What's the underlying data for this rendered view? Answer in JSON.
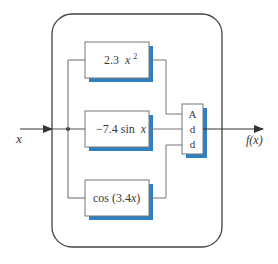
{
  "diagram": {
    "input_label": "x",
    "output_label": "f(x)",
    "blocks": [
      {
        "id": "top",
        "coef": "2.3",
        "term": "x",
        "sup": "2"
      },
      {
        "id": "middle",
        "coef": "−7.4 sin",
        "term": "x"
      },
      {
        "id": "bottom",
        "coef": "cos (3.4",
        "term": "x",
        "close": ")"
      }
    ],
    "adder": {
      "letters": [
        "A",
        "d",
        "d"
      ]
    }
  },
  "colors": {
    "line": "#555555",
    "box_border": "#777777",
    "shadow": "#2f7fc1",
    "outer_border": "#444444"
  }
}
